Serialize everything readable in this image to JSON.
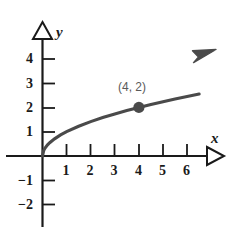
{
  "chart_data": {
    "type": "line",
    "title": "",
    "subtitle": "",
    "xlabel": "x",
    "ylabel": "y",
    "xlim": [
      -0.85,
      7.1
    ],
    "ylim": [
      -2.6,
      4.85
    ],
    "xticks": [
      1,
      2,
      3,
      4,
      5,
      6
    ],
    "yticks": [
      4,
      3,
      2,
      1,
      -1,
      -2
    ],
    "xtick_labels": [
      "1",
      "2",
      "3",
      "4",
      "5",
      "6"
    ],
    "ytick_labels": [
      "4",
      "3",
      "2",
      "1",
      "−1",
      "−2"
    ],
    "grid": false,
    "legend": null,
    "series": [
      {
        "name": "y = sqrt(x)",
        "equation": "y = √x",
        "color": "#4a4a4a",
        "arrow_end": true,
        "x": [
          0,
          0.05,
          0.1,
          0.2,
          0.3,
          0.5,
          0.75,
          1,
          1.5,
          2,
          2.5,
          3,
          3.5,
          4,
          4.5,
          5,
          5.5,
          6,
          6.5
        ],
        "y": [
          0,
          0.2236,
          0.3162,
          0.4472,
          0.5477,
          0.7071,
          0.866,
          1,
          1.2247,
          1.4142,
          1.5811,
          1.7321,
          1.8708,
          2,
          2.1213,
          2.2361,
          2.3452,
          2.4495,
          2.5495
        ]
      }
    ],
    "points": [
      {
        "x": 4,
        "y": 2,
        "label": "(4, 2)",
        "marker": "filled-circle",
        "color": "#4a4a4a",
        "label_color": "#5a5a5a"
      }
    ],
    "annotations": [],
    "axis_arrow_style": "hollow-triangle",
    "colors": {
      "axis": "#1a1a1a",
      "curve": "#4a4a4a",
      "point": "#4a4a4a",
      "point_label": "#5a5a5a",
      "background": "#ffffff"
    }
  }
}
